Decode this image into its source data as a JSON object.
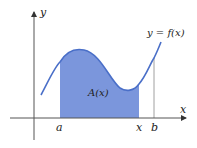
{
  "diagram": {
    "axes": {
      "x_label": "x",
      "y_label": "y",
      "axis_color": "#555555"
    },
    "curve": {
      "label": "y = f(x)",
      "stroke_color": "#4a6fc8"
    },
    "area": {
      "label": "A(x)",
      "fill_color": "#7b96dc"
    },
    "ticks": {
      "a": "a",
      "x": "x",
      "b": "b"
    }
  }
}
